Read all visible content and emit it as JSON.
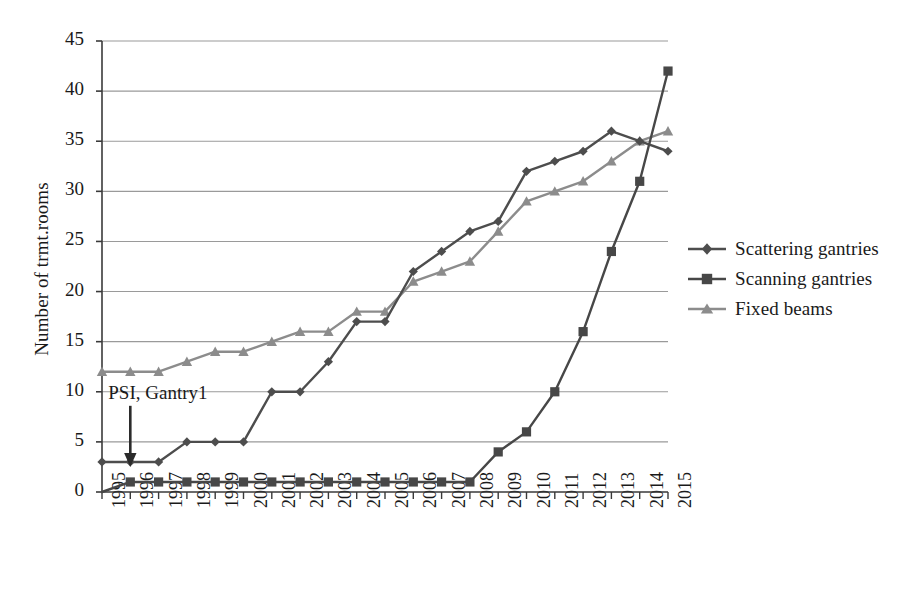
{
  "chart_data": {
    "type": "line",
    "title": "",
    "xlabel": "",
    "ylabel": "Number of trmt.rooms",
    "categories": [
      "1995",
      "1996",
      "1997",
      "1998",
      "1999",
      "2000",
      "2001",
      "2002",
      "2003",
      "2004",
      "2005",
      "2006",
      "2007",
      "2008",
      "2009",
      "2010",
      "2011",
      "2012",
      "2013",
      "2014",
      "2015"
    ],
    "ylim": [
      0,
      45
    ],
    "yticks": [
      0,
      5,
      10,
      15,
      20,
      25,
      30,
      35,
      40,
      45
    ],
    "grid": true,
    "legend_position": "right",
    "series": [
      {
        "name": "Scattering gantries",
        "marker": "diamond",
        "color": "#4d4d4d",
        "values": [
          3,
          3,
          3,
          5,
          5,
          5,
          10,
          10,
          13,
          17,
          17,
          22,
          24,
          26,
          27,
          32,
          33,
          34,
          36,
          35,
          34
        ]
      },
      {
        "name": "Scanning gantries",
        "marker": "square",
        "color": "#474747",
        "values": [
          0,
          1,
          1,
          1,
          1,
          1,
          1,
          1,
          1,
          1,
          1,
          1,
          1,
          1,
          4,
          6,
          10,
          16,
          24,
          31,
          42
        ]
      },
      {
        "name": "Fixed beams",
        "marker": "triangle",
        "color": "#8c8c8c",
        "values": [
          12,
          12,
          12,
          13,
          14,
          14,
          15,
          16,
          16,
          18,
          18,
          21,
          22,
          23,
          26,
          29,
          30,
          31,
          33,
          35,
          36
        ]
      }
    ],
    "annotations": [
      {
        "text": "PSI, Gantry1",
        "points_to_category": "1996",
        "points_to_value": 3
      }
    ]
  },
  "legend": {
    "items": [
      {
        "label": "Scattering gantries"
      },
      {
        "label": "Scanning gantries"
      },
      {
        "label": "Fixed beams"
      }
    ]
  },
  "colors": {
    "axis": "#3a3a3a",
    "grid": "#9a9a9a",
    "scattering": "#4d4d4d",
    "scanning": "#474747",
    "fixed": "#8c8c8c",
    "text": "#1a1a1a",
    "background": "#ffffff"
  }
}
